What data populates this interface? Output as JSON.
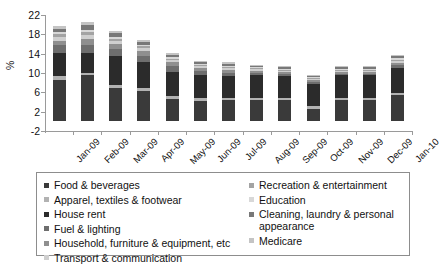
{
  "chart_data": {
    "type": "bar",
    "subtype": "stacked-column",
    "title": "",
    "xlabel": "",
    "ylabel": "%",
    "ylim": [
      -2,
      22
    ],
    "yticks": [
      22,
      18,
      14,
      10,
      6,
      2,
      -2
    ],
    "grid": false,
    "legend_position": "bottom",
    "categories": [
      "Jan-09",
      "Feb-09",
      "Mar-09",
      "Apr-09",
      "May-09",
      "Jun-09",
      "Jul-09",
      "Aug-09",
      "Sep-09",
      "Oct-09",
      "Nov-09",
      "Dec-09",
      "Jan-10"
    ],
    "series": [
      {
        "name": "Food & beverages",
        "color": "#3a3a3a",
        "values": [
          8.6,
          9.5,
          7.0,
          6.2,
          4.6,
          4.3,
          4.4,
          4.5,
          4.4,
          2.6,
          4.4,
          4.5,
          5.4
        ]
      },
      {
        "name": "Apparel, textiles & footwear",
        "color": "#b2b2b2",
        "values": [
          0.7,
          0.5,
          0.6,
          0.7,
          0.6,
          0.5,
          0.4,
          0.4,
          0.4,
          0.5,
          0.4,
          0.4,
          0.4
        ]
      },
      {
        "name": "House rent",
        "color": "#2b2b2b",
        "values": [
          4.9,
          4.2,
          6.0,
          5.4,
          5.1,
          4.7,
          4.6,
          4.7,
          4.6,
          4.7,
          4.7,
          4.6,
          5.2
        ]
      },
      {
        "name": "Fuel & lighting",
        "color": "#6e6e6e",
        "values": [
          1.5,
          1.6,
          1.4,
          1.3,
          1.2,
          0.9,
          0.7,
          0.5,
          0.4,
          0.3,
          0.3,
          0.3,
          0.6
        ]
      },
      {
        "name": "Household, furniture & equipment, etc",
        "color": "#8f8f8f",
        "values": [
          1.0,
          1.2,
          1.0,
          0.9,
          0.7,
          0.6,
          0.5,
          0.4,
          0.4,
          0.4,
          0.4,
          0.4,
          0.5
        ]
      },
      {
        "name": "Transport & communication",
        "color": "#cfcfcf",
        "values": [
          0.8,
          0.9,
          0.7,
          0.6,
          0.5,
          0.4,
          0.4,
          0.3,
          0.3,
          0.3,
          0.3,
          0.3,
          0.4
        ]
      },
      {
        "name": "Recreation & entertainment",
        "color": "#a3a3a3",
        "values": [
          0.5,
          0.6,
          0.4,
          0.4,
          0.3,
          0.3,
          0.3,
          0.2,
          0.2,
          0.2,
          0.2,
          0.2,
          0.3
        ]
      },
      {
        "name": "Education",
        "color": "#d8d8d8",
        "values": [
          0.4,
          0.5,
          0.4,
          0.3,
          0.3,
          0.2,
          0.2,
          0.2,
          0.2,
          0.2,
          0.2,
          0.2,
          0.3
        ]
      },
      {
        "name": "Cleaning, laundry & personal appearance",
        "color": "#787878",
        "values": [
          0.8,
          0.9,
          0.7,
          0.6,
          0.5,
          0.4,
          0.4,
          0.3,
          0.3,
          0.3,
          0.3,
          0.3,
          0.4
        ]
      },
      {
        "name": "Medicare",
        "color": "#c4c4c4",
        "values": [
          0.6,
          0.7,
          0.5,
          0.4,
          0.4,
          0.3,
          0.3,
          0.2,
          0.2,
          0.2,
          0.2,
          0.2,
          0.3
        ]
      }
    ],
    "totals": [
      19.8,
      20.6,
      18.7,
      16.8,
      14.2,
      12.6,
      12.2,
      11.7,
      11.4,
      9.7,
      11.4,
      11.4,
      13.8
    ]
  },
  "yaxis": {
    "title": "%",
    "ticks": [
      "22",
      "18",
      "14",
      "10",
      "6",
      "2",
      "-2"
    ]
  },
  "xaxis": {
    "labels": [
      "Jan-09",
      "Feb-09",
      "Mar-09",
      "Apr-09",
      "May-09",
      "Jun-09",
      "Jul-09",
      "Aug-09",
      "Sep-09",
      "Oct-09",
      "Nov-09",
      "Dec-09",
      "Jan-10"
    ]
  },
  "legend": {
    "left_column": [
      {
        "label": "Food & beverages",
        "color": "#3a3a3a"
      },
      {
        "label": "Apparel, textiles & footwear",
        "color": "#b2b2b2"
      },
      {
        "label": "House rent",
        "color": "#2b2b2b"
      },
      {
        "label": "Fuel & lighting",
        "color": "#6e6e6e"
      },
      {
        "label": "Household, furniture & equipment, etc",
        "color": "#8f8f8f"
      },
      {
        "label": "Transport & communication",
        "color": "#cfcfcf"
      }
    ],
    "right_column": [
      {
        "label": "Recreation & entertainment",
        "color": "#a3a3a3"
      },
      {
        "label": "Education",
        "color": "#d8d8d8"
      },
      {
        "label": "Cleaning, laundry & personal appearance",
        "color": "#787878"
      },
      {
        "label": "Medicare",
        "color": "#c4c4c4"
      }
    ]
  }
}
